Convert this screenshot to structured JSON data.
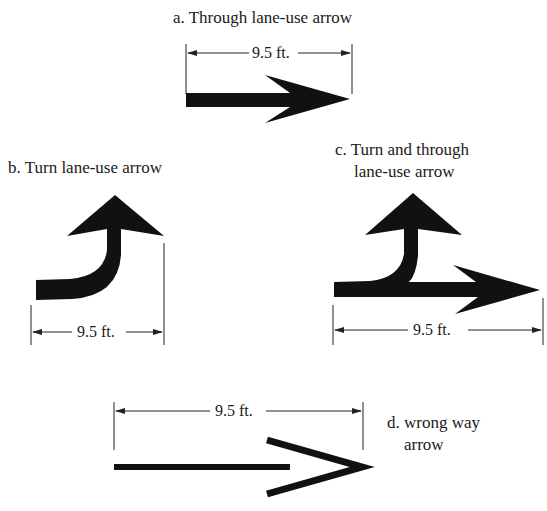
{
  "figure": {
    "panels": [
      {
        "id": "a",
        "label": "a. Through lane-use arrow",
        "dimension": "9.5 ft."
      },
      {
        "id": "b",
        "label": "b. Turn lane-use arrow",
        "dimension": "9.5 ft."
      },
      {
        "id": "c",
        "label_line1": "c. Turn and through",
        "label_line2": "lane-use arrow",
        "dimension": "9.5 ft."
      },
      {
        "id": "d",
        "label_line1": "d. wrong way",
        "label_line2": "arrow",
        "dimension": "9.5 ft."
      }
    ],
    "colors": {
      "ink": "#111111",
      "line": "#222222",
      "background": "#ffffff"
    }
  }
}
